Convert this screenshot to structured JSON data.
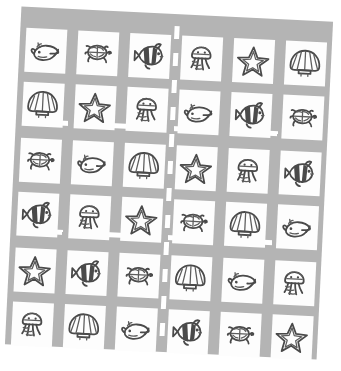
{
  "scene": {
    "title": "Sea creature picture card grid",
    "board_color": "#b4b4b4",
    "card_color": "#fdfdfd",
    "ink_color": "#4a4a4a",
    "road_marking_color": "#ffffff",
    "rows": 6,
    "columns": 6,
    "total_cards": 36,
    "rotation_degrees": 2.8
  },
  "legend": {
    "creatures": [
      {
        "key": "whale",
        "label": "Whale"
      },
      {
        "key": "turtle",
        "label": "Sea turtle"
      },
      {
        "key": "clownfish",
        "label": "Clownfish"
      },
      {
        "key": "jellyfish",
        "label": "Jellyfish"
      },
      {
        "key": "starfish",
        "label": "Starfish"
      },
      {
        "key": "shell",
        "label": "Scallop shell"
      }
    ]
  },
  "dividers": {
    "vertical_center": "dashed-white-lane-line",
    "horizontal": [
      "dashed-white-lane-line",
      "dashed-white-lane-line"
    ]
  },
  "grid": [
    {
      "row": 1,
      "left": [
        "whale",
        "turtle",
        "clownfish"
      ],
      "right": [
        "jellyfish",
        "starfish",
        "shell"
      ]
    },
    {
      "row": 2,
      "left": [
        "shell",
        "starfish",
        "jellyfish"
      ],
      "right": [
        "whale",
        "clownfish",
        "turtle"
      ]
    },
    {
      "row": 3,
      "left": [
        "turtle",
        "whale",
        "shell"
      ],
      "right": [
        "starfish",
        "jellyfish",
        "clownfish"
      ]
    },
    {
      "row": 4,
      "left": [
        "clownfish",
        "jellyfish",
        "starfish"
      ],
      "right": [
        "turtle",
        "shell",
        "whale"
      ]
    },
    {
      "row": 5,
      "left": [
        "starfish",
        "clownfish",
        "turtle"
      ],
      "right": [
        "shell",
        "whale",
        "jellyfish"
      ]
    },
    {
      "row": 6,
      "left": [
        "jellyfish",
        "shell",
        "whale"
      ],
      "right": [
        "clownfish",
        "turtle",
        "starfish"
      ]
    }
  ]
}
